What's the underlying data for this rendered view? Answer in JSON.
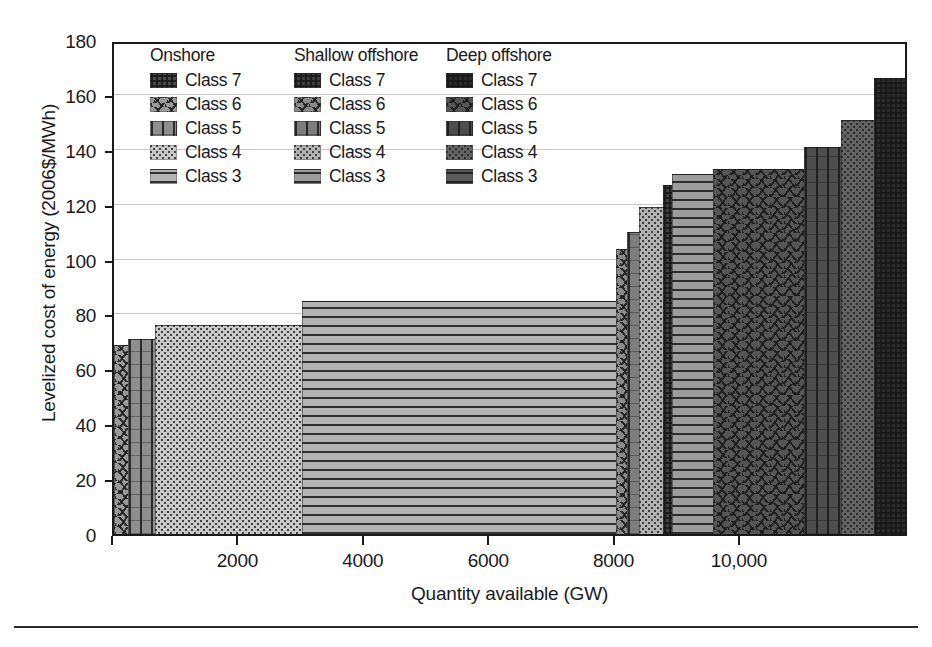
{
  "axes": {
    "y_title": "Levelized cost of energy (2006$/MWh)",
    "x_title": "Quantity available (GW)",
    "y_ticks": [
      "0",
      "20",
      "40",
      "60",
      "80",
      "100",
      "120",
      "140",
      "160",
      "180"
    ],
    "x_ticks": [
      "2000",
      "4000",
      "6000",
      "8000",
      "10,000"
    ]
  },
  "legend": {
    "columns": [
      {
        "heading": "Onshore",
        "items": [
          {
            "label": "Class 7",
            "pattern": "dense-grid",
            "color": "#4a4a4a"
          },
          {
            "label": "Class 6",
            "pattern": "squiggle",
            "color": "#9a9a9a"
          },
          {
            "label": "Class 5",
            "pattern": "vertical-grid",
            "color": "#8e8e8e"
          },
          {
            "label": "Class 4",
            "pattern": "dots",
            "color": "#c9c9c9"
          },
          {
            "label": "Class 3",
            "pattern": "horizontal-lines",
            "color": "#b4b4b4"
          }
        ]
      },
      {
        "heading": "Shallow offshore",
        "items": [
          {
            "label": "Class 7",
            "pattern": "dense-grid",
            "color": "#3f3f3f"
          },
          {
            "label": "Class 6",
            "pattern": "squiggle",
            "color": "#8a8a8a"
          },
          {
            "label": "Class 5",
            "pattern": "vertical-grid",
            "color": "#7d7d7d"
          },
          {
            "label": "Class 4",
            "pattern": "dots",
            "color": "#b2b2b2"
          },
          {
            "label": "Class 3",
            "pattern": "horizontal-lines",
            "color": "#9c9c9c"
          }
        ]
      },
      {
        "heading": "Deep offshore",
        "items": [
          {
            "label": "Class 7",
            "pattern": "dense-grid",
            "color": "#2a2a2a"
          },
          {
            "label": "Class 6",
            "pattern": "squiggle",
            "color": "#555555"
          },
          {
            "label": "Class 5",
            "pattern": "vertical-grid",
            "color": "#4d4d4d"
          },
          {
            "label": "Class 4",
            "pattern": "dots",
            "color": "#636363"
          },
          {
            "label": "Class 3",
            "pattern": "horizontal-lines",
            "color": "#5a5a5a"
          }
        ]
      }
    ]
  },
  "chart_data": {
    "type": "bar",
    "title": "",
    "xlabel": "Quantity available (GW)",
    "ylabel": "Levelized cost of energy (2006$/MWh)",
    "xlim": [
      0,
      12680
    ],
    "ylim": [
      0,
      180
    ],
    "grid": true,
    "legend_position": "upper-left-inside",
    "note": "Supply curve: each segment is a wind resource class; x spans cumulative quantity available, y is levelized cost of energy.",
    "segments": [
      {
        "group": "Onshore",
        "class": "Class 6",
        "pattern": "squiggle",
        "color": "#9a9a9a",
        "x_start": 0,
        "x_end": 220,
        "cost": 69
      },
      {
        "group": "Onshore",
        "class": "Class 5",
        "pattern": "vertical-grid",
        "color": "#8e8e8e",
        "x_start": 220,
        "x_end": 660,
        "cost": 71
      },
      {
        "group": "Onshore",
        "class": "Class 4",
        "pattern": "dots",
        "color": "#c9c9c9",
        "x_start": 660,
        "x_end": 3000,
        "cost": 76
      },
      {
        "group": "Onshore",
        "class": "Class 3",
        "pattern": "horizontal-lines",
        "color": "#b4b4b4",
        "x_start": 3000,
        "x_end": 8000,
        "cost": 85
      },
      {
        "group": "Shallow offshore",
        "class": "Class 6",
        "pattern": "squiggle",
        "color": "#8a8a8a",
        "x_start": 8000,
        "x_end": 8180,
        "cost": 104
      },
      {
        "group": "Shallow offshore",
        "class": "Class 5",
        "pattern": "vertical-grid",
        "color": "#7d7d7d",
        "x_start": 8180,
        "x_end": 8380,
        "cost": 110
      },
      {
        "group": "Shallow offshore",
        "class": "Class 4",
        "pattern": "dots",
        "color": "#b2b2b2",
        "x_start": 8380,
        "x_end": 8760,
        "cost": 119
      },
      {
        "group": "Shallow offshore",
        "class": "Class 7",
        "pattern": "dense-grid",
        "color": "#3f3f3f",
        "x_start": 8760,
        "x_end": 8900,
        "cost": 127
      },
      {
        "group": "Shallow offshore",
        "class": "Class 3",
        "pattern": "horizontal-lines",
        "color": "#9c9c9c",
        "x_start": 8900,
        "x_end": 9560,
        "cost": 131
      },
      {
        "group": "Deep offshore",
        "class": "Class 6",
        "pattern": "squiggle",
        "color": "#555555",
        "x_start": 9560,
        "x_end": 11000,
        "cost": 133
      },
      {
        "group": "Deep offshore",
        "class": "Class 5",
        "pattern": "vertical-grid",
        "color": "#4d4d4d",
        "x_start": 11000,
        "x_end": 11600,
        "cost": 141
      },
      {
        "group": "Deep offshore",
        "class": "Class 4",
        "pattern": "dots",
        "color": "#636363",
        "x_start": 11600,
        "x_end": 12120,
        "cost": 151
      },
      {
        "group": "Deep offshore",
        "class": "Class 7",
        "pattern": "dense-grid",
        "color": "#2a2a2a",
        "x_start": 12120,
        "x_end": 12680,
        "cost": 166
      }
    ]
  }
}
